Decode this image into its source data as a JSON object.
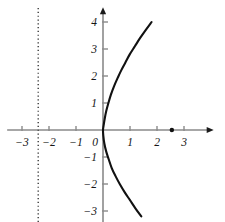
{
  "chart_data": {
    "type": "line",
    "title": "",
    "subtitle": "",
    "xlabel": "",
    "ylabel": "",
    "xlim": [
      -3.55,
      4.1
    ],
    "ylim": [
      -3.55,
      4.55
    ],
    "grid": false,
    "legend": null,
    "x_ticks": [
      -3,
      -2,
      -1,
      0,
      1,
      2,
      3
    ],
    "x_tick_labels": [
      "−3",
      "−2",
      "−1",
      "0",
      "1",
      "2",
      "3"
    ],
    "y_ticks": [
      -3,
      -2,
      -1,
      1,
      2,
      3,
      4
    ],
    "y_tick_labels": [
      "−3",
      "−2",
      "−1",
      "1",
      "2",
      "3",
      "4"
    ],
    "series": [
      {
        "name": "parabola",
        "type": "line",
        "color": "#111111",
        "equation": "x = 0.1 y^2",
        "points": [
          [
            1.8,
            4.0
          ],
          [
            1.58,
            3.7
          ],
          [
            1.37,
            3.4
          ],
          [
            1.18,
            3.1
          ],
          [
            0.99,
            2.8
          ],
          [
            0.83,
            2.5
          ],
          [
            0.67,
            2.2
          ],
          [
            0.54,
            1.92
          ],
          [
            0.4,
            1.6
          ],
          [
            0.29,
            1.3
          ],
          [
            0.2,
            1.0
          ],
          [
            0.12,
            0.7
          ],
          [
            0.06,
            0.4
          ],
          [
            0.02,
            0.15
          ],
          [
            0.0,
            0.0
          ],
          [
            0.01,
            -0.2
          ],
          [
            0.05,
            -0.5
          ],
          [
            0.12,
            -0.8
          ],
          [
            0.2,
            -1.05
          ],
          [
            0.32,
            -1.4
          ],
          [
            0.46,
            -1.7
          ],
          [
            0.62,
            -2.0
          ],
          [
            0.8,
            -2.3
          ],
          [
            1.0,
            -2.6
          ],
          [
            1.2,
            -2.9
          ],
          [
            1.42,
            -3.2
          ]
        ]
      }
    ],
    "annotations": [
      {
        "name": "directrix",
        "kind": "vertical-dotted-line",
        "x": -2.4,
        "y_from": -3.55,
        "y_to": 4.55,
        "color": "#2b2b2b"
      },
      {
        "name": "focus",
        "kind": "point",
        "x": 2.55,
        "y": 0,
        "color": "#111111",
        "radius": 2.2
      }
    ],
    "axes_style": {
      "axis_color": "#8a8a8a",
      "arrowheads": [
        "x-positive",
        "y-positive"
      ],
      "tick_length": 4
    }
  }
}
